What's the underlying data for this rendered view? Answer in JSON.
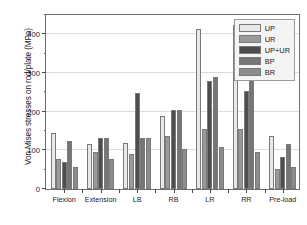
{
  "chart_data": {
    "type": "bar",
    "title": "",
    "subtitle": "",
    "xlabel": "",
    "ylabel": "Von Mises stresses on rod/plate (MPa)",
    "categories": [
      "Flexion",
      "Extension",
      "LB",
      "RB",
      "LR",
      "RR",
      "Pre-load"
    ],
    "series": [
      {
        "name": "UP",
        "color": "#e8e8e8",
        "values": [
          144,
          117,
          120,
          189,
          415,
          423,
          138
        ]
      },
      {
        "name": "UR",
        "color": "#9a9a9a",
        "values": [
          78,
          95,
          91,
          137,
          156,
          155,
          52
        ]
      },
      {
        "name": "UP+UR",
        "color": "#4d4d4d",
        "values": [
          69,
          131,
          248,
          205,
          279,
          254,
          84
        ]
      },
      {
        "name": "BP",
        "color": "#757575",
        "values": [
          123,
          132,
          132,
          205,
          289,
          292,
          116
        ]
      },
      {
        "name": "BR",
        "color": "#8c8c8c",
        "values": [
          56,
          77,
          133,
          103,
          108,
          95,
          56
        ]
      }
    ],
    "ylim": [
      0,
      450
    ],
    "yticks": [
      0,
      100,
      200,
      300,
      400
    ],
    "ytick_labels": [
      "0",
      "100",
      "200",
      "300",
      "400"
    ],
    "yminor_ticks": [
      50,
      150,
      250,
      350,
      450
    ],
    "grid": true,
    "grid_axis": "y",
    "legend_position": "top-right",
    "legend_entries": [
      "UP",
      "UR",
      "UP+UR",
      "BP",
      "BR"
    ]
  }
}
